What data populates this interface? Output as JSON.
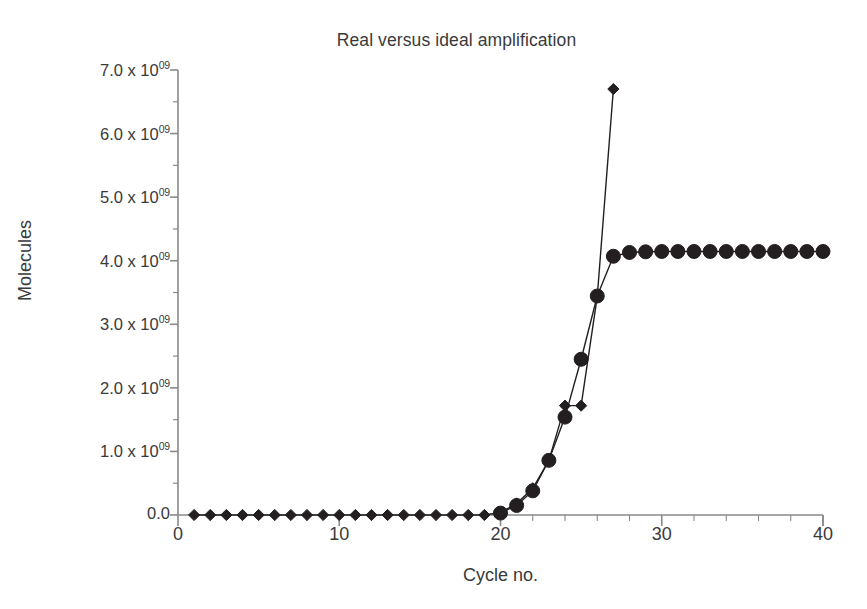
{
  "chart_data": {
    "type": "line",
    "title": "Real versus ideal amplification",
    "xlabel": "Cycle no.",
    "ylabel": "Molecules",
    "xlim": [
      0,
      40
    ],
    "ylim": [
      0,
      7000000000
    ],
    "grid": false,
    "legend": "none",
    "x_ticks": [
      "0",
      "10",
      "20",
      "30",
      "40"
    ],
    "x_tick_values": [
      0,
      10,
      20,
      30,
      40
    ],
    "x_minor_tick_step": 2,
    "y_ticks": [
      {
        "mantissa": "0.0",
        "exponent": "",
        "value": 0
      },
      {
        "mantissa": "1.0 x 10",
        "exponent": "09",
        "value": 1000000000
      },
      {
        "mantissa": "2.0 x 10",
        "exponent": "09",
        "value": 2000000000
      },
      {
        "mantissa": "3.0 x 10",
        "exponent": "09",
        "value": 3000000000
      },
      {
        "mantissa": "4.0 x 10",
        "exponent": "09",
        "value": 4000000000
      },
      {
        "mantissa": "5.0 x 10",
        "exponent": "09",
        "value": 5000000000
      },
      {
        "mantissa": "6.0 x 10",
        "exponent": "09",
        "value": 6000000000
      },
      {
        "mantissa": "7.0 x 10",
        "exponent": "09",
        "value": 7000000000
      }
    ],
    "series": [
      {
        "name": "ideal",
        "marker": "diamond",
        "color": "#231f20",
        "x": [
          1,
          2,
          3,
          4,
          5,
          6,
          7,
          8,
          9,
          10,
          11,
          12,
          13,
          14,
          15,
          16,
          17,
          18,
          19,
          20,
          21,
          22,
          23,
          24,
          25,
          26,
          27
        ],
        "values": [
          1600,
          3200,
          6400,
          12800,
          25600,
          51200,
          102400,
          204800,
          409600,
          819200,
          1638400,
          3276800,
          6553600,
          13107200,
          26214400,
          52428800,
          104857600,
          209715200,
          419430400,
          838860800,
          1677721600,
          3355443200,
          6710886400,
          13421772800,
          26843545600,
          3435000000,
          6700000000
        ],
        "plotted_y": [
          0,
          0,
          0,
          0,
          0,
          0,
          0,
          0,
          0,
          0,
          0,
          0,
          0,
          0,
          0,
          0,
          0,
          0,
          0,
          40000000,
          180000000,
          420000000,
          860000000,
          1720000000,
          1720000000,
          3435000000,
          6700000000
        ]
      },
      {
        "name": "real",
        "marker": "circle",
        "color": "#231f20",
        "x": [
          20,
          21,
          22,
          23,
          24,
          25,
          26,
          27,
          28,
          29,
          30,
          31,
          32,
          33,
          34,
          35,
          36,
          37,
          38,
          39,
          40
        ],
        "values": [
          30000000,
          150000000,
          380000000,
          860000000,
          1540000000,
          2450000000,
          3445000000,
          4070000000,
          4130000000,
          4140000000,
          4145000000,
          4145000000,
          4145000000,
          4145000000,
          4145000000,
          4145000000,
          4145000000,
          4145000000,
          4145000000,
          4145000000,
          4145000000
        ]
      }
    ],
    "plateau_value": 4145000000,
    "ideal_peak": {
      "cycle": 27,
      "value": 6700000000
    }
  }
}
